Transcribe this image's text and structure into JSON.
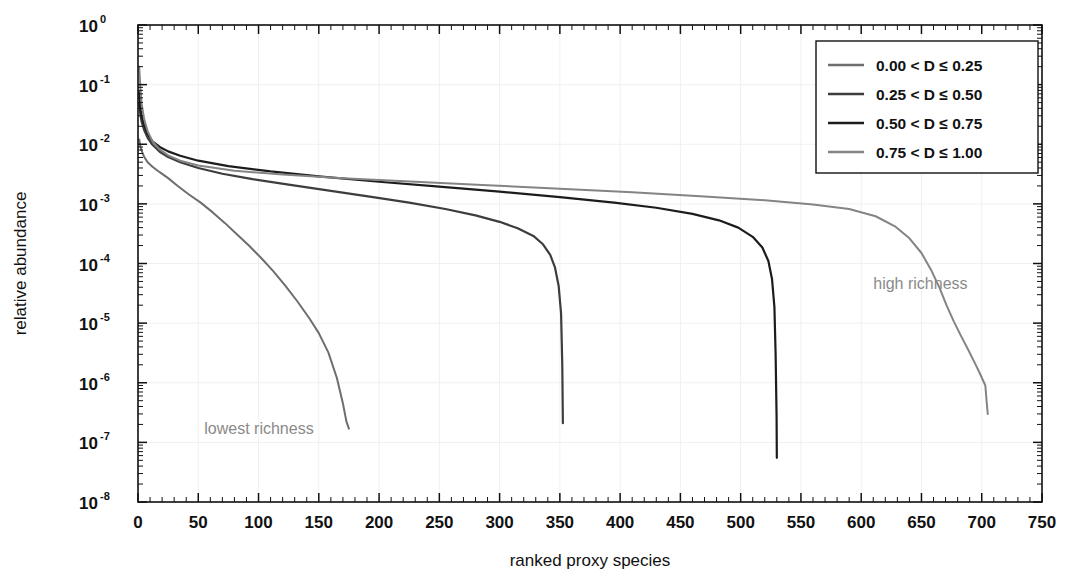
{
  "chart_data": {
    "type": "line",
    "title": "",
    "xlabel": "ranked proxy species",
    "ylabel": "relative abundance",
    "xlim": [
      0,
      750
    ],
    "ylim": [
      1e-08,
      1
    ],
    "yscale": "log",
    "xscale": "linear",
    "grid": true,
    "legend_position": "top-right",
    "xticks": [
      0,
      50,
      100,
      150,
      200,
      250,
      300,
      350,
      400,
      450,
      500,
      550,
      600,
      650,
      700,
      750
    ],
    "xtick_labels": [
      "0",
      "50",
      "100",
      "150",
      "200",
      "250",
      "300",
      "350",
      "400",
      "450",
      "500",
      "550",
      "600",
      "650",
      "700",
      "750"
    ],
    "yticks": [
      1,
      0.1,
      0.01,
      0.001,
      0.0001,
      1e-05,
      1e-06,
      1e-07,
      1e-08
    ],
    "ytick_labels": [
      "10^0",
      "10^-1",
      "10^-2",
      "10^-3",
      "10^-4",
      "10^-5",
      "10^-6",
      "10^-7",
      "10^-8"
    ],
    "ytick_mantissa": [
      "10",
      "10",
      "10",
      "10",
      "10",
      "10",
      "10",
      "10",
      "10"
    ],
    "ytick_exponent": [
      "0",
      "-1",
      "-2",
      "-3",
      "-4",
      "-5",
      "-6",
      "-7",
      "-8"
    ],
    "annotations": [
      {
        "text": "lowest richness",
        "x": 55,
        "y": 1.7e-07,
        "color": "#8a8a8a"
      },
      {
        "text": "high richness",
        "x": 610,
        "y": 4.5e-05,
        "color": "#8a8a8a"
      }
    ],
    "series": [
      {
        "name": "0.00 < D ≤ 0.25",
        "color": "#6e6e6e",
        "width": 2.0,
        "points": [
          [
            1,
            0.012
          ],
          [
            2,
            0.0092
          ],
          [
            3,
            0.0078
          ],
          [
            5,
            0.0062
          ],
          [
            8,
            0.005
          ],
          [
            12,
            0.0042
          ],
          [
            18,
            0.0034
          ],
          [
            25,
            0.0027
          ],
          [
            33,
            0.002
          ],
          [
            42,
            0.00145
          ],
          [
            52,
            0.00105
          ],
          [
            62,
            0.00072
          ],
          [
            72,
            0.00048
          ],
          [
            82,
            0.00031
          ],
          [
            92,
            0.0002
          ],
          [
            102,
            0.000125
          ],
          [
            112,
            7.5e-05
          ],
          [
            122,
            4.3e-05
          ],
          [
            132,
            2.35e-05
          ],
          [
            142,
            1.22e-05
          ],
          [
            150,
            6.8e-06
          ],
          [
            158,
            3.2e-06
          ],
          [
            165,
            1.2e-06
          ],
          [
            170,
            4.5e-07
          ],
          [
            173,
            2.2e-07
          ],
          [
            175,
            1.7e-07
          ]
        ]
      },
      {
        "name": "0.25 < D ≤ 0.50",
        "color": "#3d3d3d",
        "width": 2.2,
        "points": [
          [
            1,
            0.048
          ],
          [
            2,
            0.031
          ],
          [
            3,
            0.024
          ],
          [
            5,
            0.0175
          ],
          [
            8,
            0.0128
          ],
          [
            12,
            0.0098
          ],
          [
            18,
            0.0075
          ],
          [
            25,
            0.0061
          ],
          [
            35,
            0.005
          ],
          [
            50,
            0.004
          ],
          [
            70,
            0.0032
          ],
          [
            95,
            0.0026
          ],
          [
            125,
            0.0021
          ],
          [
            160,
            0.00165
          ],
          [
            195,
            0.0013
          ],
          [
            225,
            0.00105
          ],
          [
            255,
            0.00082
          ],
          [
            280,
            0.00064
          ],
          [
            300,
            0.0005
          ],
          [
            315,
            0.00039
          ],
          [
            328,
            0.00029
          ],
          [
            336,
            0.00021
          ],
          [
            342,
            0.00014
          ],
          [
            346,
            8.5e-05
          ],
          [
            349,
            4.2e-05
          ],
          [
            351,
            1.45e-05
          ],
          [
            352,
            2e-06
          ],
          [
            352.5,
            2.1e-07
          ]
        ]
      },
      {
        "name": "0.50 < D ≤ 0.75",
        "color": "#1c1c1c",
        "width": 2.2,
        "points": [
          [
            1,
            0.075
          ],
          [
            2,
            0.04
          ],
          [
            3,
            0.03
          ],
          [
            5,
            0.021
          ],
          [
            8,
            0.0148
          ],
          [
            12,
            0.0112
          ],
          [
            18,
            0.009
          ],
          [
            25,
            0.0076
          ],
          [
            35,
            0.0064
          ],
          [
            50,
            0.0053
          ],
          [
            75,
            0.0043
          ],
          [
            110,
            0.0035
          ],
          [
            150,
            0.0029
          ],
          [
            200,
            0.00235
          ],
          [
            250,
            0.00195
          ],
          [
            300,
            0.0016
          ],
          [
            350,
            0.0013
          ],
          [
            395,
            0.00105
          ],
          [
            430,
            0.00086
          ],
          [
            460,
            0.00068
          ],
          [
            482,
            0.00053
          ],
          [
            498,
            0.0004
          ],
          [
            510,
            0.00028
          ],
          [
            518,
            0.000185
          ],
          [
            523,
            0.00011
          ],
          [
            526,
            5.5e-05
          ],
          [
            528,
            1.85e-05
          ],
          [
            529,
            3e-06
          ],
          [
            529.8,
            2.6e-07
          ],
          [
            530,
            5.5e-08
          ]
        ]
      },
      {
        "name": "0.75 < D ≤ 1.00",
        "color": "#848484",
        "width": 2.0,
        "points": [
          [
            1,
            0.2
          ],
          [
            2,
            0.085
          ],
          [
            3,
            0.048
          ],
          [
            5,
            0.027
          ],
          [
            8,
            0.0165
          ],
          [
            12,
            0.0112
          ],
          [
            18,
            0.0082
          ],
          [
            25,
            0.0065
          ],
          [
            35,
            0.0053
          ],
          [
            50,
            0.0044
          ],
          [
            80,
            0.0036
          ],
          [
            120,
            0.0031
          ],
          [
            170,
            0.0027
          ],
          [
            230,
            0.00235
          ],
          [
            290,
            0.00205
          ],
          [
            350,
            0.0018
          ],
          [
            410,
            0.00156
          ],
          [
            470,
            0.00133
          ],
          [
            520,
            0.00115
          ],
          [
            560,
            0.00098
          ],
          [
            590,
            0.00082
          ],
          [
            612,
            0.00062
          ],
          [
            628,
            0.00042
          ],
          [
            640,
            0.000265
          ],
          [
            650,
            0.00015
          ],
          [
            658,
            7.8e-05
          ],
          [
            665,
            3.9e-05
          ],
          [
            671,
            1.95e-05
          ],
          [
            677,
            1.05e-05
          ],
          [
            683,
            6e-06
          ],
          [
            689,
            3.5e-06
          ],
          [
            694,
            2.2e-06
          ],
          [
            698,
            1.5e-06
          ],
          [
            701,
            1.1e-06
          ],
          [
            703,
            9e-07
          ],
          [
            704,
            5e-07
          ],
          [
            705,
            3e-07
          ]
        ]
      }
    ]
  },
  "legend": {
    "items": [
      {
        "label": "0.00 < D ≤ 0.25",
        "color": "#6e6e6e"
      },
      {
        "label": "0.25 < D ≤ 0.50",
        "color": "#3d3d3d"
      },
      {
        "label": "0.50 < D ≤ 0.75",
        "color": "#1c1c1c"
      },
      {
        "label": "0.75 < D ≤ 1.00",
        "color": "#848484"
      }
    ]
  },
  "style": {
    "frame_color": "#111111",
    "grid_color": "#f0f0f0",
    "background": "#ffffff",
    "annotation_color": "#8a8a8a"
  }
}
